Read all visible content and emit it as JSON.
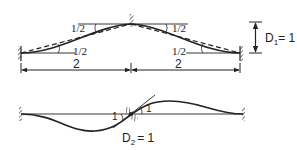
{
  "diagram": {
    "type": "structural-deflection-diagram",
    "top_figure": {
      "description": "Beam deflected shape for unit vertical displacement D1",
      "span_labels": [
        "2",
        "2"
      ],
      "angle_labels": [
        "1/2",
        "1/2",
        "1/2",
        "1/2"
      ],
      "displacement_label": "D",
      "displacement_subscript": "1",
      "displacement_value": "= 1"
    },
    "bottom_figure": {
      "description": "Beam deflected shape for unit rotation D2 at middle joint",
      "angle_labels": [
        "1",
        "1"
      ],
      "rotation_label": "D",
      "rotation_subscript": "2",
      "rotation_value": "= 1"
    },
    "colors": {
      "line": "#222222",
      "background": "#ffffff"
    }
  }
}
